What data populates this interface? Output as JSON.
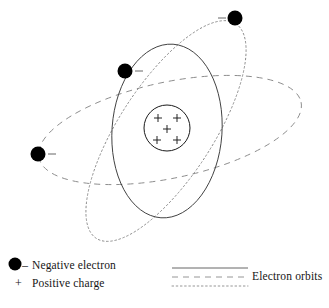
{
  "diagram": {
    "type": "atom-schematic",
    "nucleus": {
      "name": "nucleus",
      "center_x": 167,
      "center_y": 128,
      "radius": 23,
      "charge_symbol": "+",
      "charge_count": 5,
      "charge_positions": [
        {
          "x": 158,
          "y": 118
        },
        {
          "x": 177,
          "y": 118
        },
        {
          "x": 167,
          "y": 129
        },
        {
          "x": 157,
          "y": 140
        },
        {
          "x": 177,
          "y": 140
        }
      ],
      "stroke": "#1a1a1a"
    },
    "orbits": [
      {
        "name": "orbit-solid",
        "style": "solid",
        "center_x": 167,
        "center_y": 131,
        "rx": 55,
        "ry": 87,
        "rotation_deg": 4,
        "stroke": "#333333"
      },
      {
        "name": "orbit-dashed",
        "style": "dashed",
        "center_x": 170,
        "center_y": 130,
        "rx": 134,
        "ry": 48,
        "rotation_deg": -12,
        "stroke": "#8a8a8a"
      },
      {
        "name": "orbit-dotted",
        "style": "dotted",
        "center_x": 166,
        "center_y": 131,
        "rx": 128,
        "ry": 47,
        "rotation_deg": -57,
        "stroke": "#8a8a8a"
      }
    ],
    "electrons": [
      {
        "name": "electron-top-right",
        "x": 235,
        "y": 18,
        "r": 7.5,
        "orbit": "orbit-dotted",
        "sign": "-",
        "sign_x": 222,
        "sign_y": 18
      },
      {
        "name": "electron-upper-left",
        "x": 125,
        "y": 71,
        "r": 7.5,
        "orbit": "orbit-solid",
        "sign": "-",
        "sign_x": 139,
        "sign_y": 71
      },
      {
        "name": "electron-far-left",
        "x": 38,
        "y": 154,
        "r": 7.5,
        "orbit": "orbit-dashed",
        "sign": "-",
        "sign_x": 51,
        "sign_y": 154
      }
    ],
    "colors": {
      "ink": "#1a1a1a",
      "solid_orbit": "#333333",
      "faint_orbit": "#8a8a8a",
      "electron_fill": "#000000",
      "background": "#ffffff"
    }
  },
  "legend": {
    "left": {
      "electron_marker": "filled-circle",
      "electron_sign": "–",
      "electron_label": "Negative electron",
      "charge_sign": "+",
      "charge_label": "Positive charge"
    },
    "right": {
      "label": "Electron orbits",
      "samples": [
        {
          "name": "legend-line-solid",
          "style": "solid",
          "y": 268
        },
        {
          "name": "legend-line-dashed",
          "style": "dashed",
          "y": 277
        },
        {
          "name": "legend-line-dotted",
          "style": "dotted",
          "y": 286
        }
      ],
      "sample_x_start": 172,
      "sample_x_end": 248
    }
  }
}
